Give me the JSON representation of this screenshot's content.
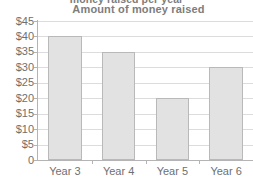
{
  "clipped_heading": "money raised per year",
  "chart_data": {
    "type": "bar",
    "title": "Amount of money raised",
    "xlabel": "",
    "ylabel": "",
    "categories": [
      "Year 3",
      "Year 4",
      "Year 5",
      "Year 6"
    ],
    "values": [
      40,
      35,
      20,
      30
    ],
    "ytick_labels": [
      "$45",
      "$40",
      "$35",
      "$30",
      "$25",
      "$20",
      "$15",
      "$10",
      "$5",
      "0"
    ],
    "ytick_values": [
      45,
      40,
      35,
      30,
      25,
      20,
      15,
      10,
      5,
      0
    ],
    "ylim": [
      0,
      45
    ],
    "grid": true,
    "legend": false,
    "colors": {
      "bar_fill": "#e2e2e2",
      "bar_border": "#b9b9b9",
      "gridline": "#dcdcdc",
      "axis": "#b4b4b4",
      "title_text": "#7d7d7d",
      "tick_text": "#6f6f6f"
    }
  }
}
